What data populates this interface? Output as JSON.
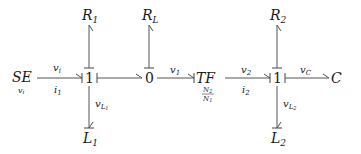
{
  "diagram": {
    "type": "bond-graph",
    "nodes": {
      "se": {
        "label": "SE",
        "sub": "v",
        "subsub": "i"
      },
      "j1": {
        "label": "1"
      },
      "j0": {
        "label": "0"
      },
      "tf": {
        "label": "TF",
        "ratio_num": "N",
        "ratio_num_sub": "2",
        "ratio_den": "N",
        "ratio_den_sub": "1"
      },
      "j1b": {
        "label": "1"
      },
      "c": {
        "label": "C"
      },
      "r1": {
        "label": "R",
        "sub": "1"
      },
      "rl": {
        "label": "R",
        "sub": "L"
      },
      "r2": {
        "label": "R",
        "sub": "2"
      },
      "l1": {
        "label": "L",
        "sub": "1"
      },
      "l2": {
        "label": "L",
        "sub": "2"
      }
    },
    "bonds": {
      "se_j1": {
        "effort": "v",
        "effort_sub": "i",
        "flow": "i",
        "flow_sub": "1"
      },
      "j0_tf": {
        "effort": "v",
        "effort_sub": "1"
      },
      "tf_j1b": {
        "effort": "v",
        "effort_sub": "2",
        "flow": "i",
        "flow_sub": "2"
      },
      "j1b_c": {
        "effort": "v",
        "effort_sub": "C"
      },
      "j1_l1": {
        "effort": "v",
        "effort_sub": "L",
        "effort_subsub": "1"
      },
      "j1b_l2": {
        "effort": "v",
        "effort_sub": "L",
        "effort_subsub": "2"
      }
    },
    "colors": {
      "line": "#555555",
      "text": "#1a1a1a"
    }
  }
}
